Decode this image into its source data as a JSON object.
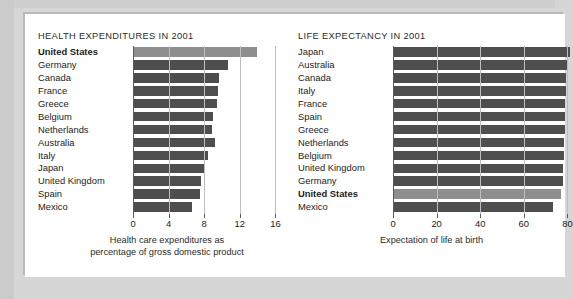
{
  "colors": {
    "page_background": "#d6d6d6",
    "card_background": "#ffffff",
    "bar": "#4e4e4e",
    "bar_highlight": "#8e8e8e",
    "axis": "#5a5a5a",
    "gridline": "#bdbdbd",
    "text": "#1d1d1d"
  },
  "chart_data": [
    {
      "type": "bar",
      "orientation": "horizontal",
      "title": "HEALTH EXPENDITURES IN 2001",
      "xlabel": "Health care expenditures as percentage of gross domestic product",
      "xlabel_lines": [
        "Health care expenditures as",
        "percentage of gross domestic product"
      ],
      "ylabel": "",
      "xlim": [
        0,
        16
      ],
      "xticks": [
        0,
        4,
        8,
        12,
        16
      ],
      "xtick_labels": [
        "0",
        "4",
        "8",
        "12",
        "16"
      ],
      "grid": true,
      "legend": "none",
      "highlight_category": "United States",
      "categories": [
        "United States",
        "Germany",
        "Canada",
        "France",
        "Greece",
        "Belgium",
        "Netherlands",
        "Australia",
        "Italy",
        "Japan",
        "United Kingdom",
        "Spain",
        "Mexico"
      ],
      "values": [
        13.9,
        10.7,
        9.7,
        9.5,
        9.4,
        9.0,
        8.9,
        9.2,
        8.4,
        8.0,
        7.6,
        7.5,
        6.6
      ]
    },
    {
      "type": "bar",
      "orientation": "horizontal",
      "title": "LIFE EXPECTANCY IN 2001",
      "xlabel": "Expectation of life at birth",
      "xlabel_lines": [
        "Expectation of life at birth"
      ],
      "ylabel": "",
      "xlim": [
        0,
        88
      ],
      "xticks": [
        0,
        20,
        40,
        60,
        80
      ],
      "xtick_labels": [
        "0",
        "20",
        "40",
        "60",
        "80"
      ],
      "grid": true,
      "legend": "none",
      "note": "Bars extend past the right edge of the screenshot and are clipped",
      "highlight_category": "United States",
      "categories": [
        "Japan",
        "Australia",
        "Canada",
        "Italy",
        "France",
        "Spain",
        "Greece",
        "Netherlands",
        "Belgium",
        "United Kingdom",
        "Germany",
        "United States",
        "Mexico"
      ],
      "values": [
        81.3,
        79.8,
        79.5,
        79.4,
        79.1,
        79.1,
        78.7,
        78.4,
        78.3,
        78.0,
        78.0,
        77.1,
        73.2
      ]
    }
  ]
}
